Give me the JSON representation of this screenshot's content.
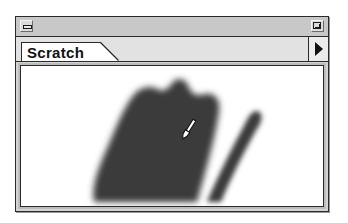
{
  "window": {
    "title": "",
    "close_box_icon": "close-box-icon",
    "zoom_box_icon": "zoom-box-icon"
  },
  "tabs": [
    {
      "label": "Scratch",
      "selected": true
    }
  ],
  "tab_scroll": {
    "icon": "right-triangle-arrow-icon"
  },
  "canvas": {
    "name": "Scratch",
    "background": "#ffffff",
    "stroke_color": "#3a3a3a",
    "cursor_icon": "paintbrush-icon"
  },
  "colors": {
    "frame": "#2a2a2a",
    "titlebar": "#c8c8c8",
    "tabrow": "#e2e2e2",
    "paint": "#3a3a3a"
  }
}
